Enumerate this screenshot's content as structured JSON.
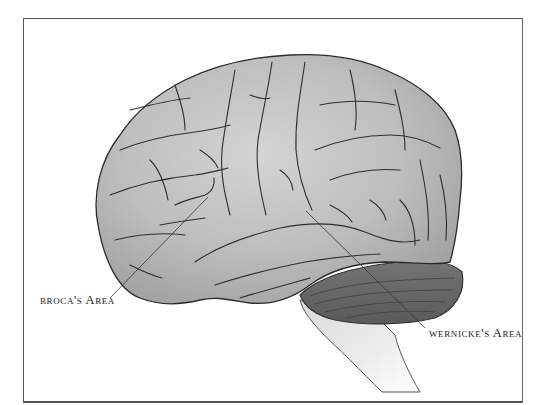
{
  "figure": {
    "labels": {
      "broca": "broca's Area",
      "wernicke": "wernicke's Area"
    },
    "colors": {
      "background": "#ffffff",
      "frame": "#555555",
      "cortex_light": "#c9c9c9",
      "cortex_mid": "#a8a8a8",
      "sulci": "#2f2f2f",
      "cerebellum": "#6a6a6a",
      "brainstem": "#e6e6e6",
      "leader_line": "#333333",
      "label_text": "#1a1a1a"
    }
  }
}
